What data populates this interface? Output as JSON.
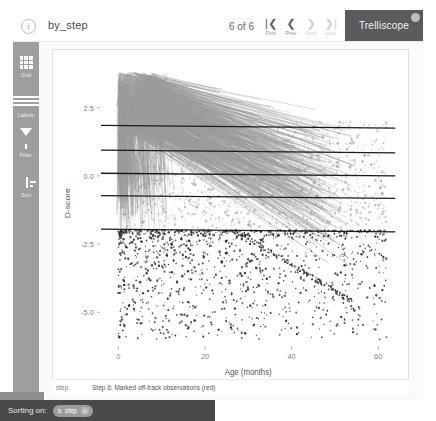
{
  "app": {
    "brand": "Trelliscope",
    "display_title": "by_step",
    "info_icon": "info-icon"
  },
  "pager": {
    "count_text": "6 of 6",
    "buttons": [
      {
        "name": "first",
        "glyph": "|❮",
        "caption": "First",
        "disabled": false
      },
      {
        "name": "prev",
        "glyph": "❮",
        "caption": "Prev",
        "disabled": false
      },
      {
        "name": "next",
        "glyph": "❯",
        "caption": "Next",
        "disabled": true
      },
      {
        "name": "last",
        "glyph": "❯|",
        "caption": "Last",
        "disabled": true
      }
    ]
  },
  "sidebar": {
    "items": [
      {
        "label": "Grid",
        "icon": "grid-icon"
      },
      {
        "label": "Labels",
        "icon": "labels-icon"
      },
      {
        "label": "Filter",
        "icon": "funnel-icon"
      },
      {
        "label": "Sort",
        "icon": "sort-icon"
      }
    ]
  },
  "panel_label": {
    "key": "step",
    "value": "Step 6: Marked off-track observations (red)"
  },
  "statusbar": {
    "sorting_label": "Sorting on:",
    "chip": {
      "icon": "sort-ascending-icon",
      "label": "step",
      "remove_icon": "×"
    }
  },
  "chart_data": {
    "type": "scatter",
    "title": "",
    "xlabel": "Age (months)",
    "ylabel": "D-score",
    "xlim": [
      -4,
      64
    ],
    "ylim": [
      -6.2,
      4.2
    ],
    "xticks": [
      0,
      20,
      40,
      60
    ],
    "yticks": [
      2.5,
      0.0,
      -2.5,
      -5.0
    ],
    "ytick_labels": [
      "2.5",
      "0.0",
      "-2.5",
      "-5.0"
    ],
    "grid": false,
    "legend": null,
    "series": [
      {
        "name": "reference lines",
        "type": "line",
        "color": "#1a1a1a",
        "description": "five horizontal reference lines (centile bands), slightly downward sloping at the right edge",
        "lines": [
          {
            "y": 1.85,
            "x_start": -4,
            "x_end": 64
          },
          {
            "y": 0.95,
            "x_start": -4,
            "x_end": 64
          },
          {
            "y": 0.1,
            "x_start": -4,
            "x_end": 64
          },
          {
            "y": -0.72,
            "x_start": -4,
            "x_end": 64
          },
          {
            "y": -1.95,
            "x_start": -4,
            "x_end": 64
          }
        ]
      },
      {
        "name": "on-track trajectories",
        "type": "line",
        "color": "#9a9a9a",
        "description": "dense gray spaghetti of individual child growth trajectories fanning out from low ages"
      },
      {
        "name": "off-track observations",
        "type": "scatter",
        "color": "#c0392b",
        "rendered_color": "#2b2b2b",
        "description": "dark red marked points lying below the lowest reference line"
      }
    ]
  }
}
